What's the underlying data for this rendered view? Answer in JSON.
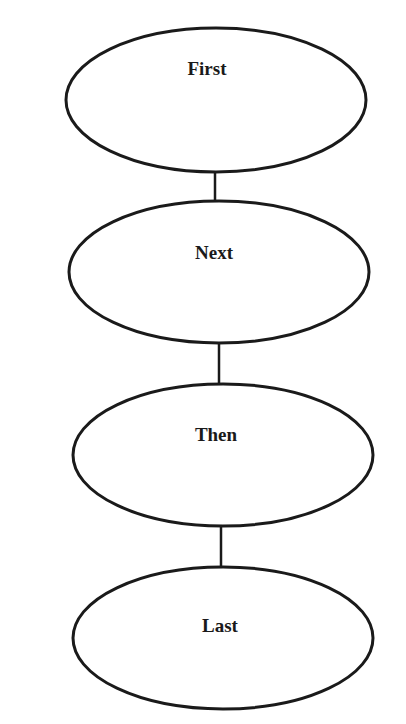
{
  "diagram": {
    "type": "vertical-flow",
    "stroke_color": "#1a1a1a",
    "background": "#ffffff",
    "nodes": [
      {
        "id": "first",
        "label": "First",
        "cx": 216,
        "cy": 100,
        "rx": 150,
        "ry": 72,
        "label_x": 207,
        "label_y": 61
      },
      {
        "id": "next",
        "label": "Next",
        "cx": 219,
        "cy": 272,
        "rx": 150,
        "ry": 71,
        "label_x": 214,
        "label_y": 245
      },
      {
        "id": "then",
        "label": "Then",
        "cx": 223,
        "cy": 455,
        "rx": 150,
        "ry": 71,
        "label_x": 216,
        "label_y": 427
      },
      {
        "id": "last",
        "label": "Last",
        "cx": 223,
        "cy": 638,
        "rx": 150,
        "ry": 71,
        "label_x": 220,
        "label_y": 618
      }
    ],
    "edges": [
      {
        "from": "first",
        "to": "next",
        "x": 215,
        "y1": 172,
        "y2": 201
      },
      {
        "from": "next",
        "to": "then",
        "x": 219,
        "y1": 343,
        "y2": 384
      },
      {
        "from": "then",
        "to": "last",
        "x": 221,
        "y1": 526,
        "y2": 567
      }
    ]
  }
}
